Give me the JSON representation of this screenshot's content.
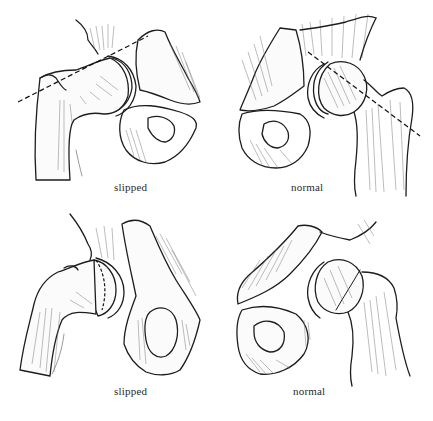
{
  "figure": {
    "panels": [
      {
        "id": "top-left",
        "caption": "slipped",
        "view": "hip joint, femoral head slipped; dashed reference line does not intersect head"
      },
      {
        "id": "top-right",
        "caption": "normal",
        "view": "hip joint, normal; dashed reference line passes through femoral head"
      },
      {
        "id": "bottom-left",
        "caption": "slipped",
        "view": "hip joint frog-leg view, slipped epiphysis with dashed physis line"
      },
      {
        "id": "bottom-right",
        "caption": "normal",
        "view": "hip joint frog-leg view, normal"
      }
    ]
  },
  "colors": {
    "background": "#ffffff",
    "ink": "#1d1d1d",
    "caption": "#2a2a2a"
  }
}
